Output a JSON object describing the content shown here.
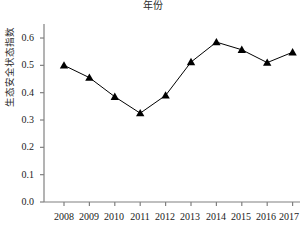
{
  "chart_data": {
    "type": "line",
    "title": "年份",
    "xlabel": "年份",
    "ylabel": "生态安全状态指数",
    "categories": [
      "2008",
      "2009",
      "2010",
      "2011",
      "2012",
      "2013",
      "2014",
      "2015",
      "2016",
      "2017"
    ],
    "values": [
      0.5,
      0.455,
      0.385,
      0.325,
      0.39,
      0.512,
      0.585,
      0.557,
      0.51,
      0.548
    ],
    "series": [
      {
        "name": "生态安全状态指数",
        "values": [
          0.5,
          0.455,
          0.385,
          0.325,
          0.39,
          0.512,
          0.585,
          0.557,
          0.51,
          0.548
        ]
      }
    ],
    "ylim": [
      0.0,
      0.65
    ],
    "yticks": [
      "0.0",
      "0.1",
      "0.2",
      "0.3",
      "0.4",
      "0.5",
      "0.6"
    ],
    "ytick_values": [
      0.0,
      0.1,
      0.2,
      0.3,
      0.4,
      0.5,
      0.6
    ],
    "grid": false,
    "legend": "none",
    "marker": "triangle",
    "line_color": "#000000",
    "marker_color": "#000000",
    "axis_color": "#808080"
  }
}
